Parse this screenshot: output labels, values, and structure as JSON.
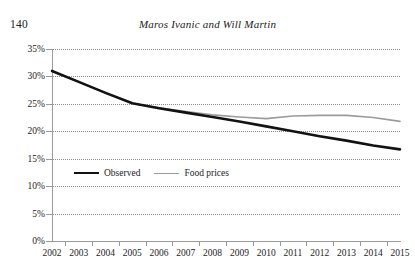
{
  "running_head": {
    "folio": "140",
    "title": "Maros Ivanic and Will Martin"
  },
  "chart_data": {
    "type": "line",
    "title": "",
    "xlabel": "",
    "ylabel": "",
    "categories": [
      "2002",
      "2003",
      "2004",
      "2005",
      "2006",
      "2007",
      "2008",
      "2009",
      "2010",
      "2011",
      "2012",
      "2013",
      "2014",
      "2015"
    ],
    "ylim": [
      0,
      35
    ],
    "ytick_labels": [
      "0%",
      "5%",
      "10%",
      "15%",
      "20%",
      "25%",
      "30%",
      "35%"
    ],
    "ytick_values": [
      0,
      5,
      10,
      15,
      20,
      25,
      30,
      35
    ],
    "grid": true,
    "legend_position": "inside-lower-left",
    "series": [
      {
        "name": "Observed",
        "color": "#121212",
        "width": 2.6,
        "values": [
          31.0,
          29.0,
          27.0,
          25.1,
          24.2,
          23.4,
          22.6,
          21.8,
          20.9,
          20.0,
          19.1,
          18.3,
          17.4,
          16.7
        ]
      },
      {
        "name": "Food prices",
        "color": "#9b9b9b",
        "width": 1.6,
        "values": [
          31.0,
          29.0,
          27.0,
          25.1,
          24.3,
          23.6,
          23.0,
          22.6,
          22.3,
          22.8,
          22.9,
          22.9,
          22.5,
          21.8
        ]
      }
    ]
  },
  "legend": {
    "items": [
      {
        "label": "Observed"
      },
      {
        "label": "Food prices"
      }
    ]
  }
}
